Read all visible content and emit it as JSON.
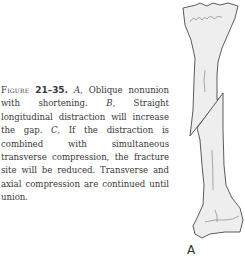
{
  "caption": {
    "figure_label": "Figure",
    "figure_number": "21–35.",
    "parts": [
      {
        "letter": "A,",
        "text": " Oblique nonunion with shortening. "
      },
      {
        "letter": "B,",
        "text": " Straight longitudinal distraction will increase the gap. "
      },
      {
        "letter": "C,",
        "text": " If the distraction is combined with simultaneous transverse compression, the fracture site will be reduced. Transverse and axial compression are continued until union."
      }
    ]
  },
  "illustration": {
    "subject": "tibia-oblique-nonunion",
    "panel_label": "A",
    "colors": {
      "bone_fill": "#eeeeee",
      "outline": "#4a4a4a"
    }
  }
}
